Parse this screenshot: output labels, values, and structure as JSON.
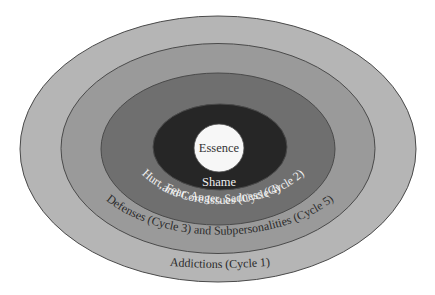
{
  "diagram": {
    "type": "concentric-ellipses",
    "rings": [
      {
        "id": "addictions",
        "label": "Addictions (Cycle 1)",
        "fill": "#b5b5b5",
        "text_color": "#2a2a2a"
      },
      {
        "id": "defenses",
        "label": "Defenses (Cycle 3) and Subpersonalities (Cycle 5)",
        "fill": "#9a9a9a",
        "text_color": "#2a2a2a"
      },
      {
        "id": "feelings",
        "label_line1": "Hurt, Fear, Anger, Sadness (Cycle 2)",
        "label_line2": "and Core Issues (Cycle 4)",
        "fill": "#6f6f6f",
        "text_color": "#f2f2f2"
      },
      {
        "id": "shame",
        "label": "Shame",
        "fill": "#262626",
        "text_color": "#eeeeee"
      },
      {
        "id": "essence",
        "label": "Essence",
        "fill": "#f7f7f7",
        "text_color": "#333333"
      }
    ],
    "stroke_color": "#4a4a4a"
  }
}
